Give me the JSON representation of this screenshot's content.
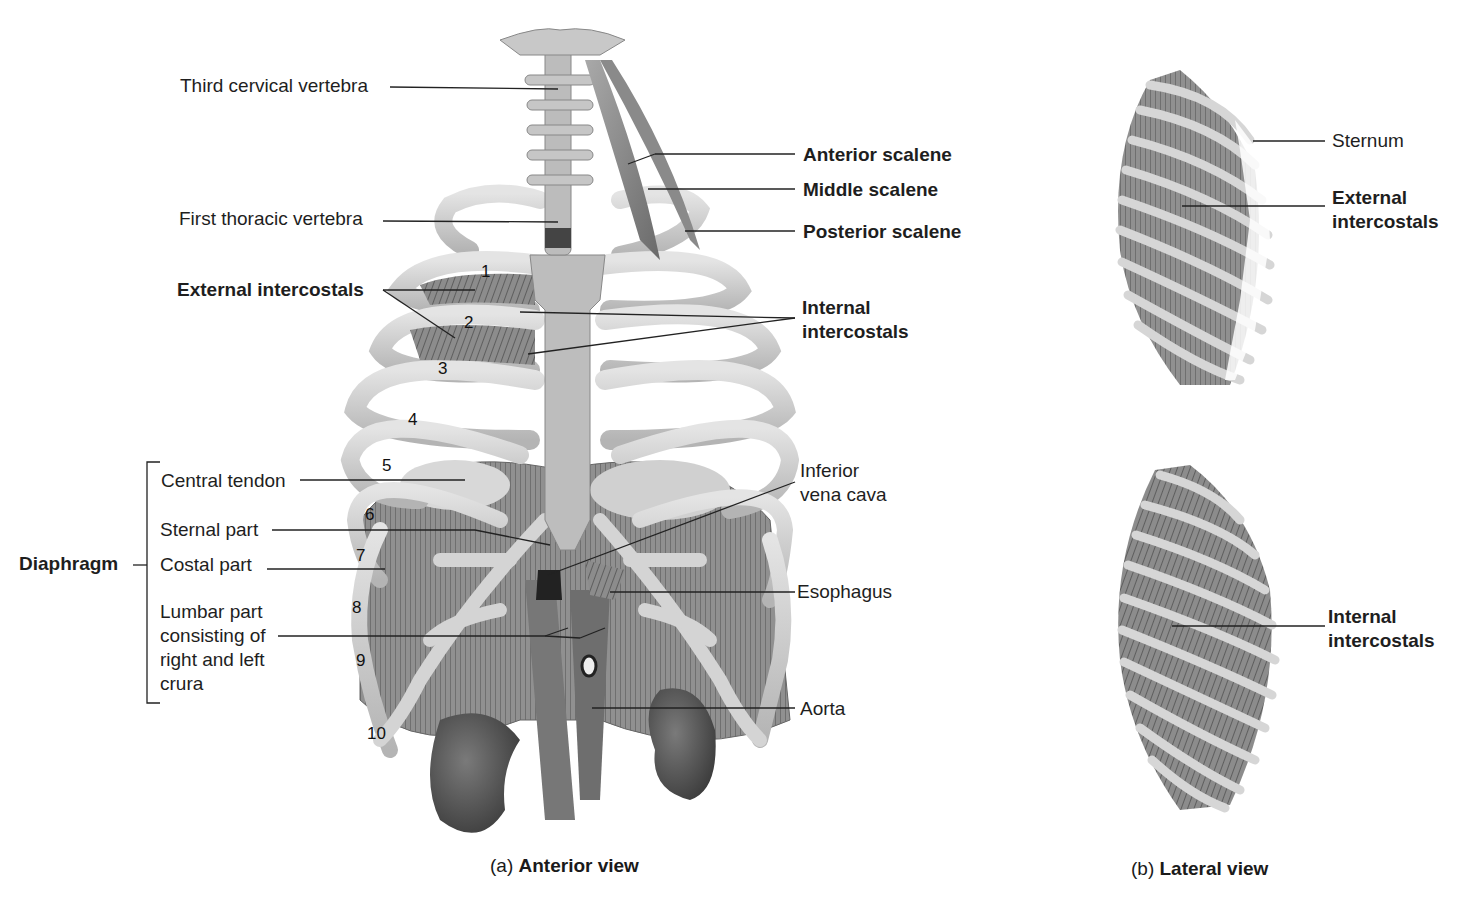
{
  "figure": {
    "panel_a": {
      "caption_prefix": "(a)",
      "caption_bold": "Anterior view",
      "labels_left": {
        "third_cervical": "Third cervical vertebra",
        "first_thoracic": "First thoracic vertebra",
        "external_intercostals": "External intercostals"
      },
      "labels_right": {
        "anterior_scalene": "Anterior scalene",
        "middle_scalene": "Middle scalene",
        "posterior_scalene": "Posterior scalene",
        "internal_intercostals": "Internal\nintercostals",
        "inferior_vena_cava": "Inferior\nvena cava",
        "esophagus": "Esophagus",
        "aorta": "Aorta"
      },
      "diaphragm": {
        "group_label": "Diaphragm",
        "parts": {
          "central_tendon": "Central tendon",
          "sternal_part": "Sternal part",
          "costal_part": "Costal part",
          "lumbar_part": "Lumbar part\nconsisting of\nright and left\ncrura"
        }
      },
      "rib_numbers": [
        "1",
        "2",
        "3",
        "4",
        "5",
        "6",
        "7",
        "8",
        "9",
        "10"
      ]
    },
    "panel_b": {
      "caption_prefix": "(b)",
      "caption_bold": "Lateral view",
      "top": {
        "sternum": "Sternum",
        "external_intercostals": "External\nintercostals"
      },
      "bottom": {
        "internal_intercostals": "Internal\nintercostals"
      }
    },
    "colors": {
      "bone": "#cfcfcf",
      "bone_edge": "#8a8a8a",
      "muscle": "#7d7d7d",
      "muscle_dark": "#5a5a5a",
      "kidney": "#4e4e4e",
      "leader_line": "#222222",
      "text": "#1e1e1e"
    }
  }
}
